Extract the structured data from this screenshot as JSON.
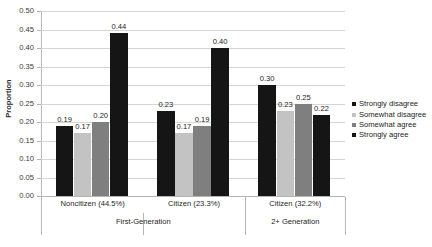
{
  "chart_data": {
    "type": "bar",
    "title": "",
    "xlabel": "",
    "ylabel": "Proportion",
    "ylim": [
      0.0,
      0.5
    ],
    "ytick_labels": [
      "0.00",
      "0.05",
      "0.10",
      "0.15",
      "0.20",
      "0.25",
      "0.30",
      "0.35",
      "0.40",
      "0.45",
      "0.50"
    ],
    "ytick_values": [
      0.0,
      0.05,
      0.1,
      0.15,
      0.2,
      0.25,
      0.3,
      0.35,
      0.4,
      0.45,
      0.5
    ],
    "grid": true,
    "legend_position": "right",
    "categories": [
      "Noncitizen (44.5%)",
      "Citizen (23.3%)",
      "Citizen (32.2%)"
    ],
    "group_labels": [
      "First-Generation",
      "2+ Generation"
    ],
    "group_spans": [
      2,
      1
    ],
    "series": [
      {
        "name": "Strongly disagree",
        "color": "#151515",
        "values": [
          0.19,
          0.23,
          0.3
        ],
        "labels": [
          "0.19",
          "0.23",
          "0.30"
        ]
      },
      {
        "name": "Somewhat disagree",
        "color": "#c3c3c3",
        "values": [
          0.17,
          0.17,
          0.23
        ],
        "labels": [
          "0.17",
          "0.17",
          "0.23"
        ]
      },
      {
        "name": "Somewhat agree",
        "color": "#7f7f7f",
        "values": [
          0.2,
          0.19,
          0.25
        ],
        "labels": [
          "0.20",
          "0.19",
          "0.25"
        ]
      },
      {
        "name": "Strongly agree",
        "color": "#151515",
        "values": [
          0.44,
          0.4,
          0.22
        ],
        "labels": [
          "0.44",
          "0.40",
          "0.22"
        ]
      }
    ]
  },
  "legend": {
    "items": [
      {
        "label": "Strongly disagree",
        "color": "#151515"
      },
      {
        "label": "Somewhat disagree",
        "color": "#c3c3c3"
      },
      {
        "label": "Somewhat agree",
        "color": "#7f7f7f"
      },
      {
        "label": "Strongly agree",
        "color": "#151515"
      }
    ]
  },
  "axis": {
    "y_title": "Proportion"
  }
}
